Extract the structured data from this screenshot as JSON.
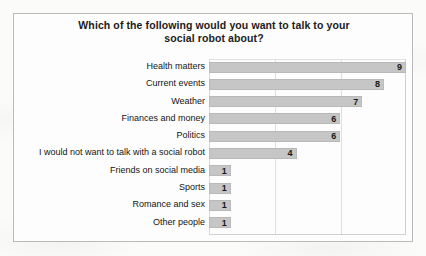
{
  "chart_data": {
    "type": "bar",
    "orientation": "horizontal",
    "title": "Which of the following would you want to talk to your social robot about?",
    "title_line1": "Which of the following would you want to talk to your",
    "title_line2": "social robot about?",
    "xlabel": "",
    "ylabel": "",
    "xlim": [
      0,
      9
    ],
    "grid": true,
    "gridlines_at": [
      3,
      6
    ],
    "legend": "none",
    "bar_color": "#c6c6c6",
    "categories": [
      "Health matters",
      "Current events",
      "Weather",
      "Finances and money",
      "Politics",
      "I would not want to talk with a social robot",
      "Friends on social media",
      "Sports",
      "Romance and sex",
      "Other people"
    ],
    "values": [
      9,
      8,
      7,
      6,
      6,
      4,
      1,
      1,
      1,
      1
    ],
    "bars": [
      {
        "label": "Health matters",
        "value": 9
      },
      {
        "label": "Current events",
        "value": 8
      },
      {
        "label": "Weather",
        "value": 7
      },
      {
        "label": "Finances and money",
        "value": 6
      },
      {
        "label": "Politics",
        "value": 6
      },
      {
        "label": "I would not want to talk with a social robot",
        "value": 4
      },
      {
        "label": "Friends on social media",
        "value": 1
      },
      {
        "label": "Sports",
        "value": 1
      },
      {
        "label": "Romance and sex",
        "value": 1
      },
      {
        "label": "Other people",
        "value": 1
      }
    ]
  }
}
